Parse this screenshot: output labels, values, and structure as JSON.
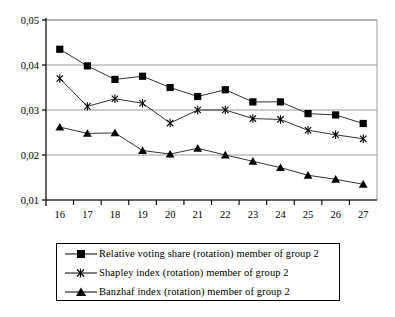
{
  "chart_data": {
    "type": "line",
    "title": "",
    "subtitle": "",
    "xlabel": "",
    "ylabel": "",
    "x": [
      16,
      17,
      18,
      19,
      20,
      21,
      22,
      23,
      24,
      25,
      26,
      27
    ],
    "xtick_labels": [
      "16",
      "17",
      "18",
      "19",
      "20",
      "21",
      "22",
      "23",
      "24",
      "25",
      "26",
      "27"
    ],
    "ytick_labels": [
      "0,01",
      "0,02",
      "0,03",
      "0,04",
      "0,05"
    ],
    "ytick_values": [
      0.01,
      0.02,
      0.03,
      0.04,
      0.05
    ],
    "ylim": [
      0.01,
      0.05
    ],
    "xlim": [
      16,
      27
    ],
    "grid": "horizontal",
    "legend_position": "bottom",
    "series": [
      {
        "name": "Relative voting share (rotation) member of group 2",
        "marker": "square",
        "values": [
          0.0435,
          0.0398,
          0.0368,
          0.0375,
          0.035,
          0.033,
          0.0345,
          0.0318,
          0.0318,
          0.0292,
          0.0289,
          0.027
        ]
      },
      {
        "name": "Shapley index (rotation) member of group 2",
        "marker": "asterisk",
        "values": [
          0.037,
          0.0308,
          0.0325,
          0.0315,
          0.0271,
          0.03,
          0.03,
          0.0281,
          0.0279,
          0.0255,
          0.0245,
          0.0236
        ]
      },
      {
        "name": "Banzhaf index (rotation) member of group 2",
        "marker": "triangle",
        "values": [
          0.0262,
          0.0248,
          0.0249,
          0.021,
          0.0202,
          0.0215,
          0.02,
          0.0186,
          0.0172,
          0.0155,
          0.0146,
          0.0135
        ]
      }
    ]
  },
  "legend": {
    "items": [
      {
        "label": "Relative voting share (rotation) member of group 2",
        "marker": "square"
      },
      {
        "label": "Shapley index (rotation) member of group 2",
        "marker": "asterisk"
      },
      {
        "label": "Banzhaf index (rotation) member of group 2",
        "marker": "triangle"
      }
    ]
  }
}
